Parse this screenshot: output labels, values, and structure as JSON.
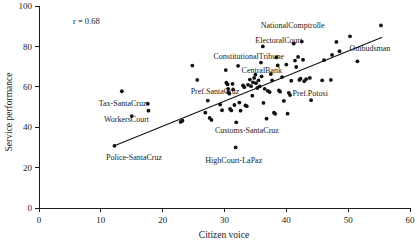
{
  "chart_data": {
    "type": "scatter",
    "title": "",
    "xlabel": "Citizen voice",
    "ylabel": "Service performance",
    "xlim": [
      0,
      60
    ],
    "ylim": [
      0,
      100
    ],
    "xticks": [
      0,
      10,
      20,
      30,
      40,
      50,
      60
    ],
    "yticks": [
      0,
      20,
      40,
      60,
      80,
      100
    ],
    "grid": false,
    "legend": "none",
    "annotations": [
      {
        "text": "r = 0.68",
        "x": 5.5,
        "y": 92.5,
        "anchor": "start"
      }
    ],
    "trend_line": {
      "x0": 12.2,
      "y0": 30.8,
      "x1": 55.5,
      "y1": 84.5
    },
    "point_labels": [
      {
        "text": "NationalComptrolle",
        "x": 46.2,
        "y": 90.5,
        "anchor": "end"
      },
      {
        "text": "ElectoralCourt",
        "x": 42.6,
        "y": 83.0,
        "anchor": "end"
      },
      {
        "text": "Ombudsman",
        "x": 50.2,
        "y": 79.0,
        "anchor": "start"
      },
      {
        "text": "ConstitutionalTribune",
        "x": 39.6,
        "y": 75.2,
        "anchor": "end"
      },
      {
        "text": "CentralBank",
        "x": 39.3,
        "y": 68.2,
        "anchor": "end"
      },
      {
        "text": "Pref.SantaCruz",
        "x": 32.4,
        "y": 57.8,
        "anchor": "end"
      },
      {
        "text": "Pref.Potosi",
        "x": 41.0,
        "y": 57.0,
        "anchor": "start"
      },
      {
        "text": "Tax-SantaCruz",
        "x": 17.4,
        "y": 51.8,
        "anchor": "end"
      },
      {
        "text": "WorkersCourt",
        "x": 17.8,
        "y": 44.0,
        "anchor": "end"
      },
      {
        "text": "Customs-SantaCruz",
        "x": 38.8,
        "y": 38.4,
        "anchor": "end"
      },
      {
        "text": "Police-SantaCruz",
        "x": 19.9,
        "y": 25.2,
        "anchor": "end"
      },
      {
        "text": "HighCourt-LaPaz",
        "x": 36.1,
        "y": 24.0,
        "anchor": "end"
      }
    ],
    "points": [
      {
        "x": 12.2,
        "y": 30.8
      },
      {
        "x": 13.4,
        "y": 57.8
      },
      {
        "x": 15.0,
        "y": 45.5
      },
      {
        "x": 17.6,
        "y": 51.6
      },
      {
        "x": 17.7,
        "y": 48.2
      },
      {
        "x": 22.9,
        "y": 42.6
      },
      {
        "x": 23.2,
        "y": 43.2
      },
      {
        "x": 24.8,
        "y": 70.5
      },
      {
        "x": 25.6,
        "y": 63.4
      },
      {
        "x": 26.9,
        "y": 47.2
      },
      {
        "x": 27.3,
        "y": 53.2
      },
      {
        "x": 27.6,
        "y": 44.6
      },
      {
        "x": 27.9,
        "y": 43.6
      },
      {
        "x": 29.3,
        "y": 51.2
      },
      {
        "x": 29.6,
        "y": 48.4
      },
      {
        "x": 30.2,
        "y": 68.3
      },
      {
        "x": 30.3,
        "y": 62.0
      },
      {
        "x": 30.5,
        "y": 61.2
      },
      {
        "x": 30.6,
        "y": 59.0
      },
      {
        "x": 30.6,
        "y": 57.3
      },
      {
        "x": 30.8,
        "y": 56.6
      },
      {
        "x": 30.9,
        "y": 49.0
      },
      {
        "x": 31.1,
        "y": 48.3
      },
      {
        "x": 31.3,
        "y": 61.4
      },
      {
        "x": 31.4,
        "y": 58.7
      },
      {
        "x": 31.6,
        "y": 51.0
      },
      {
        "x": 31.8,
        "y": 30.0
      },
      {
        "x": 31.9,
        "y": 42.4
      },
      {
        "x": 32.2,
        "y": 70.4
      },
      {
        "x": 32.4,
        "y": 52.2
      },
      {
        "x": 32.6,
        "y": 48.2
      },
      {
        "x": 33.0,
        "y": 60.7
      },
      {
        "x": 33.2,
        "y": 59.8
      },
      {
        "x": 33.4,
        "y": 50.8
      },
      {
        "x": 33.6,
        "y": 50.4
      },
      {
        "x": 33.8,
        "y": 61.0
      },
      {
        "x": 34.1,
        "y": 63.6
      },
      {
        "x": 34.3,
        "y": 60.3
      },
      {
        "x": 34.5,
        "y": 55.6
      },
      {
        "x": 34.6,
        "y": 62.2
      },
      {
        "x": 34.8,
        "y": 64.4
      },
      {
        "x": 35.0,
        "y": 66.0
      },
      {
        "x": 35.1,
        "y": 61.8
      },
      {
        "x": 35.3,
        "y": 59.4
      },
      {
        "x": 35.5,
        "y": 63.2
      },
      {
        "x": 35.7,
        "y": 60.2
      },
      {
        "x": 35.9,
        "y": 72.0
      },
      {
        "x": 36.0,
        "y": 65.2
      },
      {
        "x": 36.2,
        "y": 80.0
      },
      {
        "x": 36.3,
        "y": 52.0
      },
      {
        "x": 36.5,
        "y": 59.0
      },
      {
        "x": 36.8,
        "y": 44.2
      },
      {
        "x": 37.0,
        "y": 58.0
      },
      {
        "x": 37.3,
        "y": 57.4
      },
      {
        "x": 37.5,
        "y": 66.3
      },
      {
        "x": 37.7,
        "y": 63.2
      },
      {
        "x": 38.0,
        "y": 47.2
      },
      {
        "x": 38.2,
        "y": 46.6
      },
      {
        "x": 38.4,
        "y": 74.6
      },
      {
        "x": 38.6,
        "y": 70.6
      },
      {
        "x": 38.8,
        "y": 58.2
      },
      {
        "x": 39.0,
        "y": 57.6
      },
      {
        "x": 39.3,
        "y": 64.8
      },
      {
        "x": 39.6,
        "y": 53.0
      },
      {
        "x": 40.0,
        "y": 71.0
      },
      {
        "x": 40.2,
        "y": 46.7
      },
      {
        "x": 40.4,
        "y": 57.0
      },
      {
        "x": 40.6,
        "y": 55.9
      },
      {
        "x": 40.8,
        "y": 63.0
      },
      {
        "x": 41.2,
        "y": 81.4
      },
      {
        "x": 41.4,
        "y": 73.0
      },
      {
        "x": 41.6,
        "y": 69.8
      },
      {
        "x": 41.9,
        "y": 74.8
      },
      {
        "x": 42.1,
        "y": 63.4
      },
      {
        "x": 42.3,
        "y": 64.0
      },
      {
        "x": 42.5,
        "y": 82.4
      },
      {
        "x": 42.7,
        "y": 73.4
      },
      {
        "x": 42.9,
        "y": 62.8
      },
      {
        "x": 43.2,
        "y": 63.8
      },
      {
        "x": 43.8,
        "y": 64.4
      },
      {
        "x": 44.0,
        "y": 53.4
      },
      {
        "x": 45.8,
        "y": 63.2
      },
      {
        "x": 46.1,
        "y": 73.2
      },
      {
        "x": 47.2,
        "y": 63.4
      },
      {
        "x": 47.4,
        "y": 75.8
      },
      {
        "x": 48.1,
        "y": 82.2
      },
      {
        "x": 48.6,
        "y": 77.6
      },
      {
        "x": 50.3,
        "y": 85.0
      },
      {
        "x": 51.5,
        "y": 72.6
      },
      {
        "x": 55.3,
        "y": 90.4
      }
    ]
  }
}
